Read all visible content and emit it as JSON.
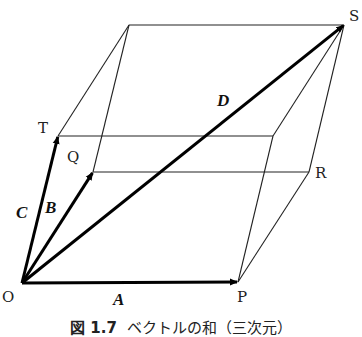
{
  "figure": {
    "caption_prefix": "図 1.7",
    "caption_text": "ベクトルの和（三次元）",
    "points": {
      "O": {
        "label": "O",
        "x": 22,
        "y": 283
      },
      "P": {
        "label": "P",
        "x": 238,
        "y": 282
      },
      "Q": {
        "label": "Q",
        "x": 93,
        "y": 172
      },
      "T": {
        "label": "T",
        "x": 58,
        "y": 136
      },
      "R": {
        "label": "R",
        "x": 309,
        "y": 172
      },
      "S": {
        "label": "S",
        "x": 344,
        "y": 25
      },
      "U": {
        "label": "",
        "x": 129,
        "y": 25
      },
      "W": {
        "label": "",
        "x": 273,
        "y": 136
      }
    },
    "vectors": [
      {
        "name": "A",
        "label": "A",
        "from": "O",
        "to": "P"
      },
      {
        "name": "B",
        "label": "B",
        "from": "O",
        "to": "Q"
      },
      {
        "name": "C",
        "label": "C",
        "from": "O",
        "to": "T"
      },
      {
        "name": "D",
        "label": "D",
        "from": "O",
        "to": "S"
      }
    ],
    "edges": [
      [
        "T",
        "U"
      ],
      [
        "Q",
        "U"
      ],
      [
        "U",
        "S"
      ],
      [
        "T",
        "W"
      ],
      [
        "Q",
        "R"
      ],
      [
        "W",
        "S"
      ],
      [
        "R",
        "S"
      ],
      [
        "P",
        "W"
      ],
      [
        "P",
        "R"
      ]
    ],
    "line_color": "#222222",
    "arrow_color": "#000000"
  }
}
